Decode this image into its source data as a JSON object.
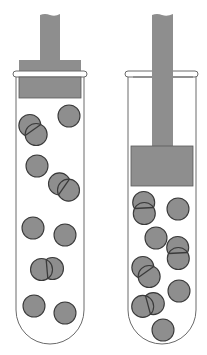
{
  "diagram": {
    "title": "",
    "colors": {
      "fill": "#8e8e8e",
      "stroke": "#3a3a3a",
      "tube_stroke": "#6a6a6a",
      "background": "#ffffff"
    },
    "tubes": [
      {
        "id": "left",
        "description": "Piston raised near top of tube; particles spread out over large volume",
        "piston_position": "high",
        "particles": [
          {
            "type": "double",
            "cx": 33,
            "cy": 130,
            "angle": -35
          },
          {
            "type": "single",
            "cx": 69,
            "cy": 116
          },
          {
            "type": "single",
            "cx": 37,
            "cy": 166
          },
          {
            "type": "double",
            "cx": 64,
            "cy": 187,
            "angle": -55
          },
          {
            "type": "single",
            "cx": 33,
            "cy": 228
          },
          {
            "type": "single",
            "cx": 65,
            "cy": 235
          },
          {
            "type": "double",
            "cx": 47,
            "cy": 269,
            "angle": 85
          },
          {
            "type": "single",
            "cx": 34,
            "cy": 306
          },
          {
            "type": "single",
            "cx": 65,
            "cy": 313
          }
        ]
      },
      {
        "id": "right",
        "description": "Piston pushed down; same particles compressed into small volume",
        "piston_position": "low",
        "particles": [
          {
            "type": "double",
            "cx": 144,
            "cy": 208,
            "angle": -3
          },
          {
            "type": "single",
            "cx": 178,
            "cy": 209
          },
          {
            "type": "single",
            "cx": 156,
            "cy": 238
          },
          {
            "type": "double",
            "cx": 178,
            "cy": 253,
            "angle": -3
          },
          {
            "type": "double",
            "cx": 146,
            "cy": 272,
            "angle": -35
          },
          {
            "type": "single",
            "cx": 179,
            "cy": 291
          },
          {
            "type": "double",
            "cx": 148,
            "cy": 305,
            "angle": 75
          },
          {
            "type": "single",
            "cx": 163,
            "cy": 330
          }
        ]
      }
    ]
  }
}
